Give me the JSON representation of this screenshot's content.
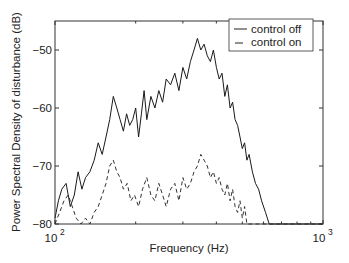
{
  "chart_data": {
    "type": "line",
    "title": "",
    "xlabel": "Frequency (Hz)",
    "ylabel": "Power Spectral Density of disturbance (dB)",
    "xscale": "log",
    "xlim": [
      100,
      1000
    ],
    "ylim": [
      -80,
      -45
    ],
    "grid": false,
    "x_ticks": [
      {
        "value": 100,
        "base": "10",
        "exp": "2"
      },
      {
        "value": 1000,
        "base": "10",
        "exp": "3"
      }
    ],
    "y_ticks": [
      {
        "value": -50,
        "label": "-50"
      },
      {
        "value": -60,
        "label": "-60"
      },
      {
        "value": -70,
        "label": "-70"
      },
      {
        "value": -80,
        "label": "-80"
      }
    ],
    "legend_position": "upper right",
    "series": [
      {
        "name": "control off",
        "style": "solid",
        "x": [
          100,
          103,
          106,
          110,
          114,
          118,
          122,
          126,
          130,
          135,
          140,
          145,
          150,
          155,
          160,
          165,
          170,
          175,
          180,
          185,
          190,
          195,
          200,
          205,
          210,
          215,
          220,
          228,
          236,
          244,
          252,
          260,
          270,
          280,
          290,
          300,
          310,
          320,
          330,
          340,
          350,
          360,
          370,
          380,
          390,
          400,
          410,
          420,
          430,
          440,
          450,
          460,
          470,
          480,
          490,
          500,
          510,
          520,
          530,
          545,
          560,
          575,
          590,
          610,
          630,
          650,
          680,
          720,
          780,
          850,
          920,
          1000
        ],
        "y": [
          -79,
          -76,
          -74,
          -73,
          -77,
          -75,
          -71,
          -74,
          -72,
          -71,
          -69,
          -66,
          -68,
          -65,
          -62,
          -58,
          -60,
          -62,
          -64,
          -61,
          -63,
          -62,
          -60,
          -65,
          -61,
          -57,
          -62,
          -58,
          -60,
          -57,
          -59,
          -55,
          -56,
          -54,
          -57,
          -53,
          -55,
          -52,
          -50,
          -48,
          -50,
          -49,
          -51,
          -52,
          -50,
          -53,
          -55,
          -54,
          -58,
          -56,
          -60,
          -59,
          -62,
          -63,
          -65,
          -67,
          -66,
          -69,
          -68,
          -71,
          -73,
          -74,
          -76,
          -78,
          -80,
          -80,
          -80,
          -80,
          -80,
          -80,
          -80,
          -80
        ]
      },
      {
        "name": "control on",
        "style": "dashed",
        "x": [
          100,
          104,
          108,
          112,
          116,
          120,
          125,
          130,
          135,
          140,
          145,
          150,
          155,
          160,
          165,
          170,
          175,
          180,
          186,
          192,
          198,
          205,
          212,
          220,
          228,
          236,
          244,
          252,
          260,
          270,
          280,
          290,
          300,
          310,
          320,
          330,
          340,
          350,
          360,
          370,
          380,
          390,
          400,
          410,
          420,
          430,
          440,
          450,
          460,
          470,
          480,
          490,
          500,
          510,
          520,
          530,
          545,
          560,
          575,
          590,
          610,
          630,
          650,
          680,
          720,
          780,
          850,
          920,
          1000
        ],
        "y": [
          -80,
          -78,
          -76,
          -75,
          -77,
          -79,
          -80,
          -79,
          -80,
          -78,
          -77,
          -75,
          -73,
          -70,
          -69,
          -71,
          -72,
          -74,
          -73,
          -76,
          -75,
          -77,
          -74,
          -72,
          -75,
          -76,
          -73,
          -75,
          -77,
          -74,
          -73,
          -76,
          -72,
          -74,
          -73,
          -71,
          -70,
          -68,
          -69,
          -70,
          -72,
          -71,
          -73,
          -72,
          -74,
          -75,
          -73,
          -76,
          -74,
          -77,
          -78,
          -76,
          -79,
          -77,
          -80,
          -80,
          -80,
          -80,
          -80,
          -80,
          -80,
          -80,
          -80,
          -80,
          -80,
          -80,
          -80,
          -80,
          -80
        ]
      }
    ]
  },
  "legend": {
    "items": [
      {
        "label": "control off"
      },
      {
        "label": "control on"
      }
    ]
  }
}
